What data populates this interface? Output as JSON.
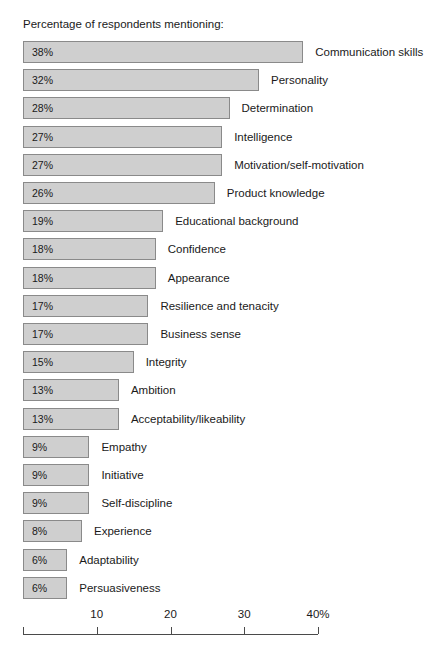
{
  "chart_data": {
    "type": "bar",
    "orientation": "horizontal",
    "title": "Percentage of respondents mentioning:",
    "xlabel": "",
    "ylabel": "",
    "xlim": [
      0,
      40
    ],
    "grid": false,
    "legend": null,
    "axis_unit_suffix": "%",
    "tick_values": [
      10,
      20,
      30,
      40
    ],
    "tick_labels": [
      "10",
      "20",
      "30",
      "40%"
    ],
    "categories": [
      "Communication skills",
      "Personality",
      "Determination",
      "Intelligence",
      "Motivation/self-motivation",
      "Product knowledge",
      "Educational background",
      "Confidence",
      "Appearance",
      "Resilience and tenacity",
      "Business sense",
      "Integrity",
      "Ambition",
      "Acceptability/likeability",
      "Empathy",
      "Initiative",
      "Self-discipline",
      "Experience",
      "Adaptability",
      "Persuasiveness"
    ],
    "values": [
      38,
      32,
      28,
      27,
      27,
      26,
      19,
      18,
      18,
      17,
      17,
      15,
      13,
      13,
      9,
      9,
      9,
      8,
      6,
      6
    ],
    "value_labels": [
      "38%",
      "32%",
      "28%",
      "27%",
      "27%",
      "26%",
      "19%",
      "18%",
      "18%",
      "17%",
      "17%",
      "15%",
      "13%",
      "13%",
      "9%",
      "9%",
      "9%",
      "8%",
      "6%",
      "6%"
    ],
    "colors": {
      "bar_fill": "#cfcfcf",
      "bar_border": "#8a8a8a",
      "text": "#1a1a1a",
      "axis": "#4a4a4a",
      "background": "#ffffff"
    }
  }
}
